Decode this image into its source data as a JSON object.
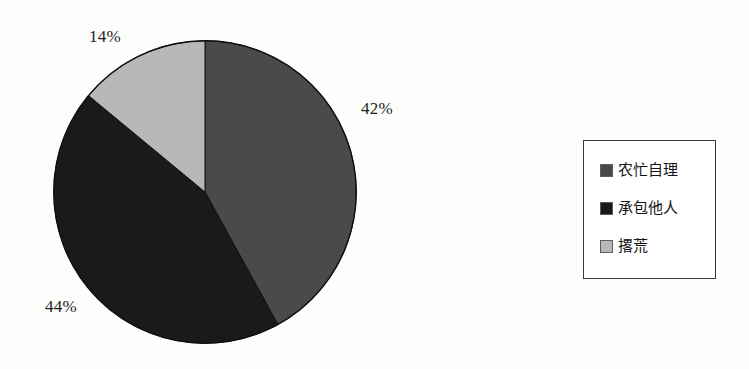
{
  "background_color": "#fdfdfc",
  "chart_data": {
    "type": "pie",
    "title": "",
    "subtitle": "",
    "xlabel": "",
    "ylabel": "",
    "grid": false,
    "legend_position": "right",
    "start_angle_deg": 0,
    "direction": "clockwise",
    "categories": [
      "农忙自理",
      "承包他人",
      "撂荒"
    ],
    "values": [
      42,
      44,
      14
    ],
    "value_unit": "%",
    "data_labels": [
      "42%",
      "44%",
      "14%"
    ],
    "colors": [
      "#4a4a4a",
      "#1a1a1a",
      "#b8b8b8"
    ],
    "slices": [
      {
        "label": "农忙自理",
        "value": 42,
        "data_label": "42%",
        "color": "#4a4a4a",
        "sweep_deg": 151.2
      },
      {
        "label": "承包他人",
        "value": 44,
        "data_label": "44%",
        "color": "#1a1a1a",
        "sweep_deg": 158.4
      },
      {
        "label": "撂荒",
        "value": 14,
        "data_label": "14%",
        "color": "#b8b8b8",
        "sweep_deg": 50.4
      }
    ]
  },
  "pie": {
    "labels": {
      "pct_42": "42%",
      "pct_44": "44%",
      "pct_14": "14%"
    }
  },
  "legend": {
    "items": [
      {
        "label": "农忙自理",
        "color": "#4a4a4a"
      },
      {
        "label": "承包他人",
        "color": "#1a1a1a"
      },
      {
        "label": "撂荒",
        "color": "#b8b8b8"
      }
    ]
  }
}
